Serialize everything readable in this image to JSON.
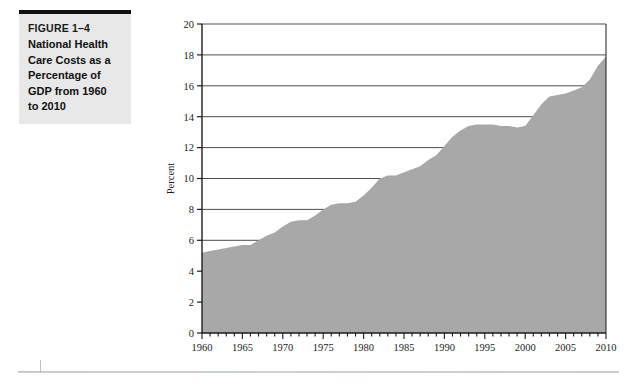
{
  "caption": {
    "figure_number": "FIGURE 1–4",
    "title_lines": [
      "National Health",
      "Care Costs as a",
      "Percentage of",
      "GDP from 1960",
      "to 2010"
    ],
    "background_color": "#e8e8e8",
    "rule_color": "#111111"
  },
  "chart_data": {
    "type": "area",
    "title": "",
    "xlabel": "",
    "ylabel": "Percent",
    "xlim": [
      1960,
      2010
    ],
    "ylim": [
      0,
      20
    ],
    "ytick_step": 2,
    "ytick_labels": [
      "0",
      "2",
      "4",
      "6",
      "8",
      "10",
      "12",
      "14",
      "16",
      "18",
      "20"
    ],
    "xtick_labels": [
      "1960",
      "1965",
      "1970",
      "1975",
      "1980",
      "1985",
      "1990",
      "1995",
      "2000",
      "2005",
      "2010"
    ],
    "xtick_major_step": 5,
    "xtick_minor_step": 1,
    "grid": "horizontal",
    "legend": "none",
    "area_fill_color": "#a8a8a8",
    "axis_color": "#1d1d1d",
    "grid_color": "#3a3a3a",
    "x": [
      1960,
      1961,
      1962,
      1963,
      1964,
      1965,
      1966,
      1967,
      1968,
      1969,
      1970,
      1971,
      1972,
      1973,
      1974,
      1975,
      1976,
      1977,
      1978,
      1979,
      1980,
      1981,
      1982,
      1983,
      1984,
      1985,
      1986,
      1987,
      1988,
      1989,
      1990,
      1991,
      1992,
      1993,
      1994,
      1995,
      1996,
      1997,
      1998,
      1999,
      2000,
      2001,
      2002,
      2003,
      2004,
      2005,
      2006,
      2007,
      2008,
      2009,
      2010
    ],
    "values": [
      5.2,
      5.3,
      5.4,
      5.5,
      5.6,
      5.7,
      5.7,
      6.0,
      6.3,
      6.5,
      6.9,
      7.2,
      7.3,
      7.3,
      7.6,
      8.0,
      8.3,
      8.4,
      8.4,
      8.5,
      8.9,
      9.4,
      10.0,
      10.2,
      10.2,
      10.4,
      10.6,
      10.8,
      11.2,
      11.5,
      12.1,
      12.7,
      13.1,
      13.4,
      13.5,
      13.5,
      13.5,
      13.4,
      13.4,
      13.3,
      13.4,
      14.1,
      14.8,
      15.3,
      15.4,
      15.5,
      15.7,
      15.9,
      16.4,
      17.3,
      17.9
    ]
  }
}
